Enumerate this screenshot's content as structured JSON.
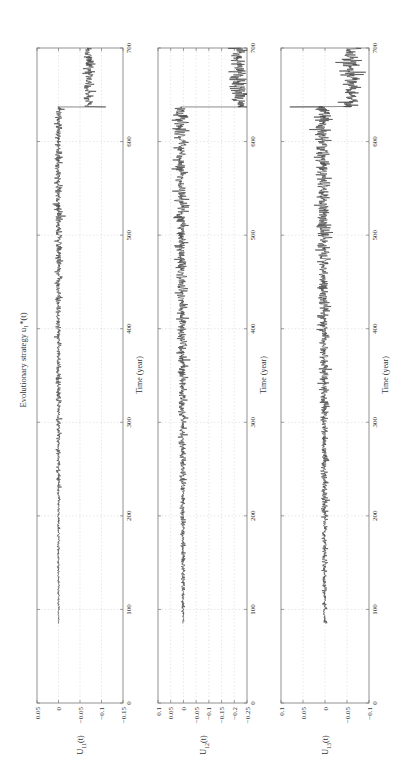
{
  "figure": {
    "title": "Evolutionary strategy u₁*(t)",
    "orientation": "rotated 90° counter-clockwise",
    "xlabel": "Time (year)",
    "x_ticks": [
      0,
      100,
      200,
      300,
      400,
      500,
      600,
      700
    ]
  },
  "chart_data": [
    {
      "type": "line",
      "title": "Evolutionary strategy u₁*(t)",
      "xlabel": "Time (year)",
      "ylabel": "U11(t)",
      "xlim": [
        0,
        700
      ],
      "ylim": [
        -0.15,
        0.05
      ],
      "x_ticks": [
        0,
        100,
        200,
        300,
        400,
        500,
        600,
        700
      ],
      "y_ticks": [
        0.05,
        0,
        -0.05,
        -0.1,
        -0.15
      ],
      "grid": true,
      "series": [
        {
          "name": "U11(t)",
          "segments": [
            {
              "x_start": 85,
              "x_end": 637,
              "mean_start": 0.0,
              "mean_end": 0.0,
              "noise_start": 0.001,
              "noise_end": 0.005
            },
            {
              "x_start": 637,
              "x_end": 700,
              "mean_start": -0.07,
              "mean_end": -0.07,
              "noise_start": 0.006,
              "noise_end": 0.006
            }
          ],
          "jump": {
            "x": 637,
            "from": 0.0,
            "spike": -0.11,
            "to": -0.07
          }
        }
      ]
    },
    {
      "type": "line",
      "title": "",
      "xlabel": "Time (year)",
      "ylabel": "U12(t)",
      "xlim": [
        0,
        700
      ],
      "ylim": [
        -0.25,
        0.1
      ],
      "x_ticks": [
        0,
        100,
        200,
        300,
        400,
        500,
        600,
        700
      ],
      "y_ticks": [
        0.1,
        0.05,
        0,
        -0.05,
        -0.1,
        -0.15,
        -0.2,
        -0.25
      ],
      "grid": true,
      "series": [
        {
          "name": "U12(t)",
          "segments": [
            {
              "x_start": 85,
              "x_end": 637,
              "mean_start": 0.0,
              "mean_end": 0.01,
              "noise_start": 0.003,
              "noise_end": 0.014
            },
            {
              "x_start": 637,
              "x_end": 700,
              "mean_start": -0.215,
              "mean_end": -0.215,
              "noise_start": 0.018,
              "noise_end": 0.018
            }
          ],
          "jump": {
            "x": 637,
            "from": 0.01,
            "spike": -0.25,
            "to": -0.215
          }
        }
      ]
    },
    {
      "type": "line",
      "title": "",
      "xlabel": "Time (year)",
      "ylabel": "U13(t)",
      "xlim": [
        0,
        700
      ],
      "ylim": [
        -0.1,
        0.1
      ],
      "x_ticks": [
        0,
        100,
        200,
        300,
        400,
        500,
        600,
        700
      ],
      "y_ticks": [
        0.1,
        0.05,
        0,
        -0.05,
        -0.1
      ],
      "grid": true,
      "series": [
        {
          "name": "U13(t)",
          "segments": [
            {
              "x_start": 85,
              "x_end": 637,
              "mean_start": 0.0,
              "mean_end": 0.005,
              "noise_start": 0.002,
              "noise_end": 0.009
            },
            {
              "x_start": 637,
              "x_end": 700,
              "mean_start": -0.06,
              "mean_end": -0.06,
              "noise_start": 0.011,
              "noise_end": 0.011
            }
          ],
          "jump": {
            "x": 637,
            "from": 0.005,
            "spike": 0.08,
            "to": -0.06
          }
        }
      ]
    }
  ],
  "layout": {
    "time_axis_px": {
      "t0": 703,
      "t700": 48
    },
    "panels_px": [
      {
        "ytop_px": 37,
        "ybottom_px": 123
      },
      {
        "ytop_px": 158,
        "ybottom_px": 247
      },
      {
        "ytop_px": 281,
        "ybottom_px": 369
      }
    ],
    "title_px": {
      "x": 26,
      "y": 360
    },
    "colors": {
      "line": "#3a3a3a",
      "frame": "#777777",
      "grid": "#cfcfcf",
      "text": "#333333"
    }
  }
}
